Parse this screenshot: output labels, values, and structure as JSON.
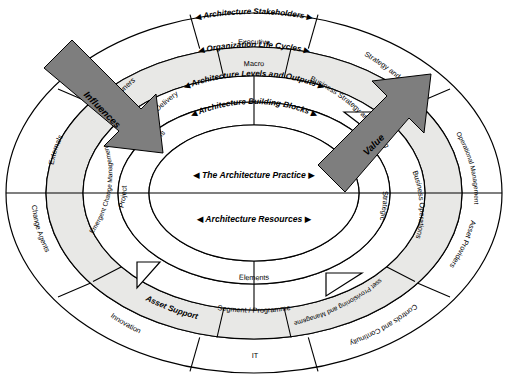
{
  "diagram": {
    "colors": {
      "arrow_fill": "#7e7e7e",
      "ring_shade": "#e8e8e6",
      "outline": "#000000",
      "background": "#ffffff"
    },
    "arrows": [
      {
        "id": "influences",
        "label": "Influences",
        "direction": "inward-from-upper-left"
      },
      {
        "id": "value",
        "label": "Value",
        "direction": "outward-to-upper-right"
      }
    ],
    "core": {
      "practice": "The Architecture Practice",
      "resources": "Architecture Resources",
      "left_marker": "◀",
      "right_marker": "▶"
    },
    "ring_headers": [
      {
        "id": "stakeholders",
        "label": "Architecture Stakeholders"
      },
      {
        "id": "lifecycles",
        "label": "Organization Life Cycles"
      },
      {
        "id": "levels",
        "label": "Architecture Levels and Outputs"
      },
      {
        "id": "blocks",
        "label": "Architecture Building Blocks"
      }
    ],
    "segments": {
      "stakeholders_ring": [
        {
          "id": "owners",
          "label": "Owners"
        },
        {
          "id": "executive",
          "label": "Executive"
        },
        {
          "id": "strategy-and-planning",
          "label": "Strategy and Planning"
        },
        {
          "id": "operational-management",
          "label": "Operational Management"
        },
        {
          "id": "asset-providers",
          "label": "Asset Providers"
        },
        {
          "id": "controls-and-continuity",
          "label": "Controls and Continuity"
        },
        {
          "id": "it",
          "label": "IT"
        },
        {
          "id": "innovation",
          "label": "Innovation"
        },
        {
          "id": "change-agents",
          "label": "Change Agents"
        },
        {
          "id": "externals",
          "label": "Externals"
        }
      ],
      "lifecycles_ring": [
        {
          "id": "change-delivery",
          "label": "Change Delivery"
        },
        {
          "id": "business-strategy-and-planning",
          "label": "Business Strategy and Planning"
        },
        {
          "id": "business-operations",
          "label": "Business Operations"
        },
        {
          "id": "asset-provisioning-and-management",
          "label": "Asset Provisioning and Management"
        },
        {
          "id": "asset-support",
          "label": "Asset Support"
        },
        {
          "id": "emergent-change-management",
          "label": "Emergent Change Management"
        }
      ],
      "levels_ring": [
        {
          "id": "macro",
          "label": "Macro"
        },
        {
          "id": "strategic",
          "label": "Strategic"
        },
        {
          "id": "segment-programme",
          "label": "Segment / Programme"
        },
        {
          "id": "project",
          "label": "Project"
        }
      ],
      "blocks_ring": [
        {
          "id": "models",
          "label": "Models"
        },
        {
          "id": "views",
          "label": "Views"
        },
        {
          "id": "elements",
          "label": "Elements"
        }
      ]
    }
  }
}
